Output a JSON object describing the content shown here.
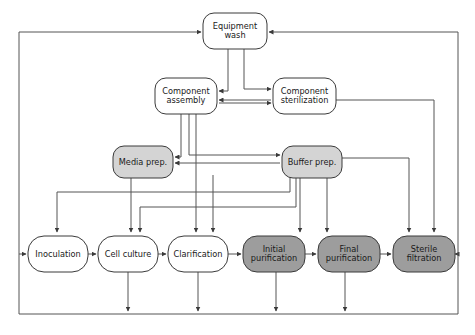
{
  "diagram": {
    "type": "process-flow",
    "canvas": {
      "width": 475,
      "height": 335
    },
    "colors": {
      "background": "#ffffff",
      "node_white_fill": "#ffffff",
      "node_light_gray_fill": "#d4d4d4",
      "node_dark_gray_fill": "#9d9d9d",
      "node_stroke": "#3a3a3a",
      "edge_stroke": "#555555",
      "label_text": "#1a1a1a"
    },
    "nodes": [
      {
        "id": "equipment-wash",
        "label": "Equipment wash",
        "lines": [
          "Equipment",
          "wash"
        ],
        "fill_class": "white",
        "x": 203,
        "y": 13,
        "w": 64,
        "h": 36,
        "r": 11
      },
      {
        "id": "component-assembly",
        "label": "Component assembly",
        "lines": [
          "Component",
          "assembly"
        ],
        "fill_class": "white",
        "x": 155,
        "y": 78,
        "w": 62,
        "h": 36,
        "r": 11
      },
      {
        "id": "component-sterilization",
        "label": "Component sterilization",
        "lines": [
          "Component",
          "sterilization"
        ],
        "fill_class": "white",
        "x": 273,
        "y": 78,
        "w": 63,
        "h": 36,
        "r": 11
      },
      {
        "id": "media-prep",
        "label": "Media prep.",
        "lines": [
          "Media prep."
        ],
        "fill_class": "light",
        "x": 113,
        "y": 146,
        "w": 60,
        "h": 32,
        "r": 11
      },
      {
        "id": "buffer-prep",
        "label": "Buffer prep.",
        "lines": [
          "Buffer prep."
        ],
        "fill_class": "light",
        "x": 282,
        "y": 146,
        "w": 60,
        "h": 32,
        "r": 11
      },
      {
        "id": "inoculation",
        "label": "Inoculation",
        "lines": [
          "Inoculation"
        ],
        "fill_class": "white",
        "x": 28,
        "y": 236,
        "w": 60,
        "h": 36,
        "r": 16
      },
      {
        "id": "cell-culture",
        "label": "Cell culture",
        "lines": [
          "Cell culture"
        ],
        "fill_class": "white",
        "x": 98,
        "y": 236,
        "w": 60,
        "h": 36,
        "r": 16
      },
      {
        "id": "clarification",
        "label": "Clarification",
        "lines": [
          "Clarification"
        ],
        "fill_class": "white",
        "x": 168,
        "y": 236,
        "w": 60,
        "h": 36,
        "r": 16
      },
      {
        "id": "initial-purification",
        "label": "Initial purification",
        "lines": [
          "Initial",
          "purification"
        ],
        "fill_class": "dark",
        "x": 243,
        "y": 236,
        "w": 62,
        "h": 36,
        "r": 14
      },
      {
        "id": "final-purification",
        "label": "Final purification",
        "lines": [
          "Final",
          "purification"
        ],
        "fill_class": "dark",
        "x": 318,
        "y": 236,
        "w": 62,
        "h": 36,
        "r": 14
      },
      {
        "id": "sterile-filtration",
        "label": "Sterile filtration",
        "lines": [
          "Sterile",
          "filtration"
        ],
        "fill_class": "dark",
        "x": 393,
        "y": 236,
        "w": 62,
        "h": 36,
        "r": 14
      }
    ],
    "edges": [
      {
        "id": "eqwash-to-assembly",
        "from": "equipment-wash",
        "to": "component-assembly",
        "points": "228,49 228,91 219,91",
        "arrow": "left"
      },
      {
        "id": "eqwash-to-sterilization",
        "from": "equipment-wash",
        "to": "component-sterilization",
        "points": "244,49 244,89 271,89",
        "arrow": "right"
      },
      {
        "id": "sterilization-to-assembly",
        "from": "component-sterilization",
        "to": "component-assembly",
        "points": "271,100 219,100",
        "arrow": "left"
      },
      {
        "id": "assembly-to-sterilization",
        "from": "component-assembly",
        "to": "component-sterilization",
        "points": "219,103 271,103",
        "arrow": "right"
      },
      {
        "id": "assembly-to-media",
        "from": "component-assembly",
        "to": "media-prep",
        "points": "181,114 181,157 175,157",
        "arrow": "left"
      },
      {
        "id": "assembly-to-buffer",
        "from": "component-assembly",
        "to": "buffer-prep",
        "points": "189,114 189,155 280,155",
        "arrow": "right"
      },
      {
        "id": "assembly-to-clarification",
        "from": "component-assembly",
        "to": "clarification",
        "points": "196,114 196,232",
        "arrow": "down"
      },
      {
        "id": "sterilization-to-sterile-filtration",
        "from": "component-sterilization",
        "to": "sterile-filtration",
        "points": "336,100 434,100 434,232",
        "arrow": "down"
      },
      {
        "id": "buffer-to-media",
        "from": "buffer-prep",
        "to": "media-prep",
        "points": "280,163 175,163",
        "arrow": "left"
      },
      {
        "id": "buffer-to-inoculation",
        "from": "buffer-prep",
        "to": "inoculation",
        "points": "290,178 290,192 57,192 57,232",
        "arrow": "down"
      },
      {
        "id": "buffer-to-cell-culture",
        "from": "buffer-prep",
        "to": "cell-culture",
        "points": "296,178 296,207 140,207 140,232",
        "arrow": "down"
      },
      {
        "id": "buffer-to-initial-purification",
        "from": "buffer-prep",
        "to": "initial-purification",
        "points": "300,178 300,232",
        "arrow": "down"
      },
      {
        "id": "buffer-to-final-purification",
        "from": "buffer-prep",
        "to": "final-purification",
        "points": "327,178 327,232",
        "arrow": "down"
      },
      {
        "id": "buffer-to-sterile-filtration",
        "from": "buffer-prep",
        "to": "sterile-filtration",
        "points": "342,158 409,158 409,232",
        "arrow": "down"
      },
      {
        "id": "media-to-cell-culture",
        "from": "media-prep",
        "to": "cell-culture",
        "points": "131,178 131,232",
        "arrow": "down"
      },
      {
        "id": "clarification-feed-line",
        "from": "component-assembly",
        "to": "clarification",
        "points": "213,175 213,232",
        "arrow": "down"
      },
      {
        "id": "inoculation-to-cell-culture",
        "from": "inoculation",
        "to": "cell-culture",
        "points": "88,254 96,254",
        "arrow": "right"
      },
      {
        "id": "cell-culture-to-clarification",
        "from": "cell-culture",
        "to": "clarification",
        "points": "158,254 166,254",
        "arrow": "right"
      },
      {
        "id": "clarification-to-initial-purification",
        "from": "clarification",
        "to": "initial-purification",
        "points": "228,254 241,254",
        "arrow": "right"
      },
      {
        "id": "initial-to-final-purification",
        "from": "initial-purification",
        "to": "final-purification",
        "points": "305,254 316,254",
        "arrow": "right"
      },
      {
        "id": "final-purification-to-sterile-filtration",
        "from": "final-purification",
        "to": "sterile-filtration",
        "points": "380,254 391,254",
        "arrow": "right"
      },
      {
        "id": "recycle-right-to-equipment-wash",
        "from": "sterile-filtration",
        "to": "equipment-wash",
        "points": "458,32 269,32",
        "arrow": "left"
      },
      {
        "id": "recycle-left-to-equipment-wash",
        "from": "inoculation",
        "to": "equipment-wash",
        "points": "19,32 201,32",
        "arrow": "right"
      },
      {
        "id": "return-to-inoculation",
        "from": "waste-header",
        "to": "inoculation",
        "points": "19,254 26,254",
        "arrow": "right"
      },
      {
        "id": "sterile-filtration-to-right-riser",
        "from": "sterile-filtration",
        "to": "right-riser",
        "points": "458,254 455,254",
        "arrow": "left"
      },
      {
        "id": "left-riser",
        "from": "waste-bus",
        "to": "equipment-wash",
        "points": "19,314 19,32",
        "arrow": "none"
      },
      {
        "id": "right-riser",
        "from": "waste-bus",
        "to": "equipment-wash",
        "points": "458,314 458,32",
        "arrow": "none"
      },
      {
        "id": "waste-bus",
        "from": "process",
        "to": "waste",
        "points": "19,314 458,314",
        "arrow": "none"
      },
      {
        "id": "cell-culture-waste",
        "from": "cell-culture",
        "to": "waste-bus",
        "points": "128,272 128,311",
        "arrow": "down"
      },
      {
        "id": "clarification-waste",
        "from": "clarification",
        "to": "waste-bus",
        "points": "198,272 198,311",
        "arrow": "down"
      },
      {
        "id": "initial-purification-waste",
        "from": "initial-purification",
        "to": "waste-bus",
        "points": "276,272 276,311",
        "arrow": "down"
      },
      {
        "id": "final-purification-waste",
        "from": "final-purification",
        "to": "waste-bus",
        "points": "345,272 345,311",
        "arrow": "down"
      }
    ]
  }
}
